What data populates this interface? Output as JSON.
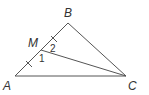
{
  "diagram": {
    "type": "triangle",
    "points": {
      "A": {
        "label": "A",
        "x": 15,
        "y": 76,
        "lx": 3,
        "ly": 90
      },
      "B": {
        "label": "B",
        "x": 68,
        "y": 23,
        "lx": 64,
        "ly": 17
      },
      "C": {
        "label": "C",
        "x": 126,
        "y": 76,
        "lx": 128,
        "ly": 90
      },
      "M": {
        "label": "M",
        "x": 41,
        "y": 50,
        "lx": 29,
        "ly": 48
      }
    },
    "segments": [
      "AB",
      "BC",
      "CA",
      "MC"
    ],
    "angles": [
      {
        "label": "1",
        "x": 40,
        "y": 61
      },
      {
        "label": "2",
        "x": 50,
        "y": 52
      }
    ],
    "tick_marks": "AM = MB",
    "colors": {
      "stroke": "#555555",
      "text": "#333333"
    }
  }
}
